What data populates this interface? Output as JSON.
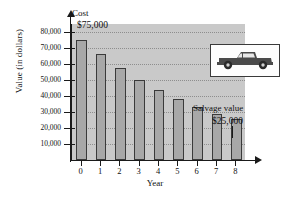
{
  "chart_data": {
    "type": "bar",
    "title": "",
    "xlabel": "Year",
    "ylabel": "Value (in dollars)",
    "axis_top_label": "Cost",
    "categories": [
      "0",
      "1",
      "2",
      "3",
      "4",
      "5",
      "6",
      "7",
      "8"
    ],
    "values": [
      75000,
      66000,
      57500,
      50000,
      43500,
      38000,
      33000,
      29000,
      25500
    ],
    "ylim": [
      0,
      85000
    ],
    "ytick_values": [
      10000,
      20000,
      30000,
      40000,
      50000,
      60000,
      70000,
      80000
    ],
    "ytick_labels": [
      "10,000",
      "20,000",
      "30,000",
      "40,000",
      "50,000",
      "60,000",
      "70,000",
      "80,000"
    ],
    "grid": true,
    "legend": "none",
    "annotations": [
      {
        "name": "cost-annotation",
        "text": "$75,000",
        "target_category": "0"
      },
      {
        "name": "salvage-label",
        "text": "Salvage value",
        "target_category": "8"
      },
      {
        "name": "salvage-annotation",
        "text": "$25,000",
        "target_category": "8"
      }
    ],
    "inset_image": "pickup-truck"
  },
  "colors": {
    "plot_background": "#c9c9c9",
    "bar_fill": "#a8a8a8",
    "bar_stroke": "#3a3a3a",
    "axis": "#1a1a1a",
    "gridline": "#8e8e8e",
    "inset_background": "#fdfdfd",
    "truck_body": "#4a4a4a"
  }
}
